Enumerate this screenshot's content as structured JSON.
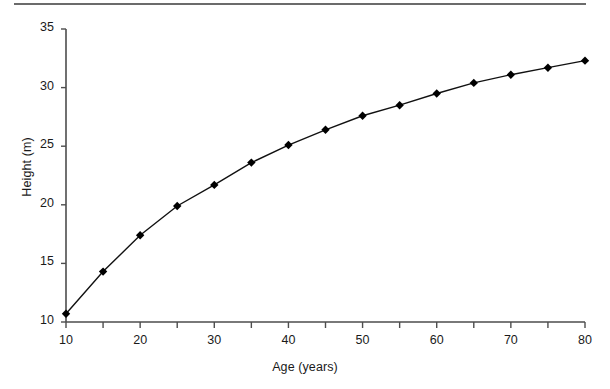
{
  "chart_data": {
    "type": "line",
    "title": "",
    "subtitle": "",
    "xlabel": "Age (years)",
    "ylabel": "Height (m)",
    "xlim": [
      10,
      80
    ],
    "ylim": [
      10,
      35
    ],
    "xticks": [
      10,
      15,
      20,
      25,
      30,
      35,
      40,
      45,
      50,
      55,
      60,
      65,
      70,
      75,
      80
    ],
    "xtick_labels": [
      "10",
      "",
      "20",
      "",
      "30",
      "",
      "40",
      "",
      "50",
      "",
      "60",
      "",
      "70",
      "",
      "80"
    ],
    "yticks": [
      10,
      15,
      20,
      25,
      30,
      35
    ],
    "ytick_labels": [
      "10",
      "15",
      "20",
      "25",
      "30",
      "35"
    ],
    "grid": false,
    "legend": null,
    "legend_position": "none",
    "marker": "diamond",
    "line_color": "#111111",
    "marker_color": "#000000",
    "axis_color": "#4d4d4d",
    "background_color": "#ffffff",
    "series": [
      {
        "name": "Height vs Age",
        "x": [
          10,
          15,
          20,
          25,
          30,
          35,
          40,
          45,
          50,
          55,
          60,
          65,
          70,
          75,
          80
        ],
        "values": [
          10.7,
          14.3,
          17.4,
          19.9,
          21.7,
          23.6,
          25.1,
          26.4,
          27.6,
          28.5,
          29.5,
          30.4,
          31.1,
          31.7,
          32.3
        ]
      }
    ],
    "annotations": []
  },
  "figure": {
    "scan_rule_name": "scan-edge-line"
  }
}
